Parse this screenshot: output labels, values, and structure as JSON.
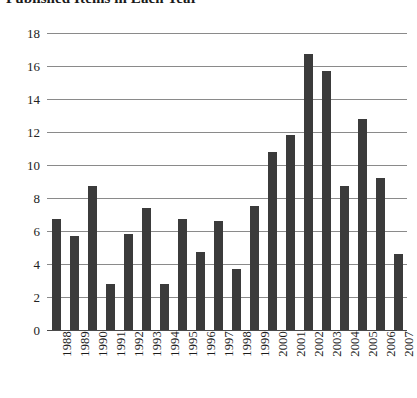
{
  "chart": {
    "title": "Published Items in Each Year"
  },
  "chart_data": {
    "type": "bar",
    "title": "Published Items in Each Year",
    "xlabel": "",
    "ylabel": "",
    "ylim": [
      0,
      18
    ],
    "ytick_labels": [
      "18",
      "16",
      "14",
      "12",
      "10",
      "8",
      "6",
      "4",
      "2",
      "0"
    ],
    "yticks": [
      18,
      16,
      14,
      12,
      10,
      8,
      6,
      4,
      2,
      0
    ],
    "grid": true,
    "legend": "none",
    "bar_color": "#3b3b3b",
    "gridline_color": "#8a8a8a",
    "categories": [
      "1988",
      "1989",
      "1990",
      "1991",
      "1992",
      "1993",
      "1994",
      "1995",
      "1996",
      "1997",
      "1998",
      "1999",
      "2000",
      "2001",
      "2002",
      "2003",
      "2004",
      "2005",
      "2006",
      "2007"
    ],
    "values": [
      6.7,
      5.7,
      8.7,
      2.8,
      5.8,
      7.4,
      2.8,
      6.7,
      4.7,
      6.6,
      3.7,
      7.5,
      10.8,
      11.8,
      16.7,
      15.7,
      8.7,
      12.8,
      9.2,
      4.6
    ]
  }
}
